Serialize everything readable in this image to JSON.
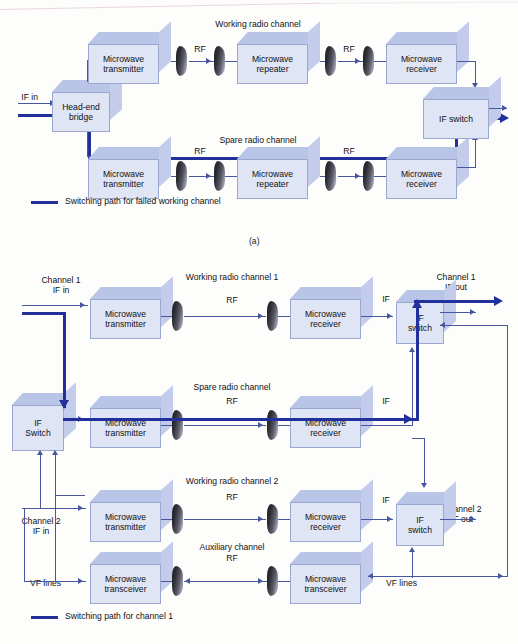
{
  "figure": {
    "title_a": "(a)",
    "panel_a": {
      "channel_labels": {
        "working": "Working radio channel",
        "spare": "Spare radio channel"
      },
      "io": {
        "if_in": "IF in"
      },
      "rf_labels": [
        "RF",
        "RF",
        "RF",
        "RF"
      ],
      "blocks": {
        "head_end": "Head-end\nbridge",
        "tx": "Microwave\ntransmitter",
        "rep": "Microwave\nrepeater",
        "rx": "Microwave\nreceiver",
        "if_switch": "IF switch"
      },
      "legend": "Switching path for failed working channel"
    },
    "panel_b": {
      "channel_labels": {
        "working1": "Working radio channel 1",
        "spare": "Spare radio channel",
        "working2": "Working radio channel 2",
        "auxiliary": "Auxiliary channel"
      },
      "io": {
        "ch1_in": "Channel 1\nIF in",
        "ch1_out": "Channel 1\nIF out",
        "ch2_in": "Channel 2\nIF in",
        "ch2_out": "Channel 2\nIF out",
        "vf_left": "VF lines",
        "vf_right": "VF lines"
      },
      "rf_labels": [
        "RF",
        "RF",
        "RF",
        "RF"
      ],
      "if_labels": [
        "IF",
        "IF",
        "IF"
      ],
      "blocks": {
        "if_switch_left": "IF\nSwitch",
        "tx": "Microwave\ntransmitter",
        "rx": "Microwave\nreceiver",
        "transceiver": "Microwave\ntransceiver",
        "if_switch_1": "IF\nswitch",
        "if_switch_2": "IF\nswitch"
      },
      "legend": "Switching path for channel 1"
    },
    "colors": {
      "box_front": "#dfe5f4",
      "box_top": "#b9c5e6",
      "box_side": "#c3cdeb",
      "box_edge": "#9aa8cf",
      "thin_line": "#46569f",
      "bold_path": "#22309b",
      "background": "#fdfdfc"
    }
  }
}
